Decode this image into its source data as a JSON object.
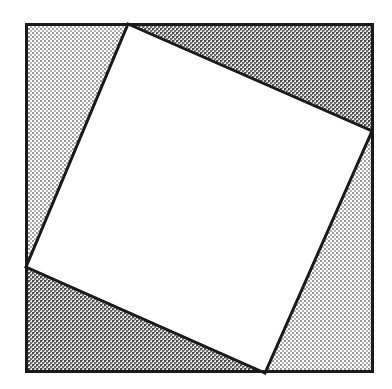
{
  "figure": {
    "title": "Square inscribed in a square",
    "canvas": {
      "width": 392,
      "height": 389,
      "background": "#ffffff"
    },
    "outer_square": {
      "name": "outer-square",
      "x": 25,
      "y": 23,
      "width": 349,
      "height": 350,
      "corners": [
        [
          25,
          23
        ],
        [
          374,
          23
        ],
        [
          374,
          373
        ],
        [
          25,
          373
        ]
      ],
      "stroke": "#1a1a1a",
      "stroke_width": 3,
      "fill": "none"
    },
    "inner_square": {
      "name": "inner-square",
      "vertices": [
        [
          128,
          24
        ],
        [
          372,
          131
        ],
        [
          265,
          373
        ],
        [
          26,
          267
        ]
      ],
      "vertex_labels": [
        "top",
        "right",
        "bottom",
        "left"
      ],
      "stroke": "#1a1a1a",
      "stroke_width": 3,
      "fill": "#ffffff",
      "rotation_degrees": 23.6
    },
    "corner_triangles": [
      {
        "name": "triangle-top-left",
        "points": [
          [
            25,
            23
          ],
          [
            128,
            24
          ],
          [
            26,
            267
          ]
        ],
        "shade": "light",
        "fill": "#d9d9d9"
      },
      {
        "name": "triangle-top-right",
        "points": [
          [
            128,
            24
          ],
          [
            374,
            23
          ],
          [
            372,
            131
          ]
        ],
        "shade": "dark",
        "fill": "#a6a6a6"
      },
      {
        "name": "triangle-bottom-right",
        "points": [
          [
            372,
            131
          ],
          [
            374,
            373
          ],
          [
            265,
            373
          ]
        ],
        "shade": "light",
        "fill": "#d9d9d9"
      },
      {
        "name": "triangle-bottom-left",
        "points": [
          [
            26,
            267
          ],
          [
            265,
            373
          ],
          [
            25,
            373
          ]
        ],
        "shade": "dark",
        "fill": "#a6a6a6"
      }
    ],
    "colors": {
      "line": "#1a1a1a",
      "light_shade": "#d9d9d9",
      "dark_shade": "#a6a6a6",
      "white": "#ffffff",
      "background": "#ffffff"
    },
    "dither": {
      "light_pattern_name": "light-dither-pattern",
      "dark_pattern_name": "dark-dither-pattern",
      "cell_size": 4,
      "light_dot_color": "#9a9a9a",
      "dark_dot_color": "#4d4d4d"
    }
  }
}
